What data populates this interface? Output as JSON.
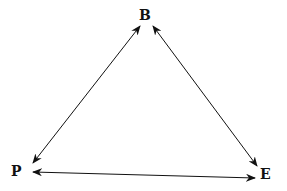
{
  "diagram": {
    "type": "triangle-relationship",
    "nodes": [
      {
        "id": "B",
        "label": "B",
        "position": "top"
      },
      {
        "id": "P",
        "label": "P",
        "position": "bottom-left"
      },
      {
        "id": "E",
        "label": "E",
        "position": "bottom-right"
      }
    ],
    "edges": [
      {
        "from": "B",
        "to": "P",
        "direction": "bidirectional"
      },
      {
        "from": "B",
        "to": "E",
        "direction": "bidirectional"
      },
      {
        "from": "P",
        "to": "E",
        "direction": "bidirectional"
      }
    ],
    "colors": {
      "stroke": "#111111",
      "background": "#ffffff"
    }
  }
}
